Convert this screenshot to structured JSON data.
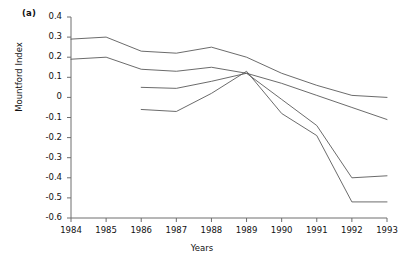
{
  "figure": {
    "panel_label": "(a)",
    "xlabel": "Years",
    "ylabel": "Mountford Index"
  },
  "chart_data": {
    "type": "line",
    "title": "",
    "subtitle": "",
    "panel_label": "(a)",
    "xlabel": "Years",
    "ylabel": "Mountford Index",
    "x": [
      1984,
      1985,
      1986,
      1987,
      1988,
      1989,
      1990,
      1991,
      1992,
      1993
    ],
    "xtick_labels": [
      "1984",
      "1985",
      "1986",
      "1987",
      "1988",
      "1989",
      "1990",
      "1991",
      "1992",
      "1993"
    ],
    "ytick_labels": [
      "0.4",
      "0.3",
      "0.2",
      "0.1",
      "0",
      "-0.1",
      "-0.2",
      "-0.3",
      "-0.4",
      "-0.5",
      "-0.6"
    ],
    "ytick_values": [
      0.4,
      0.3,
      0.2,
      0.1,
      0,
      -0.1,
      -0.2,
      -0.3,
      -0.4,
      -0.5,
      -0.6
    ],
    "xlim": [
      1984,
      1993
    ],
    "ylim": [
      -0.6,
      0.4
    ],
    "grid": false,
    "legend": "none",
    "line_color": "#5a5a5a",
    "series": [
      {
        "name": "series-1",
        "x": [
          1984,
          1985,
          1986,
          1987,
          1988,
          1989,
          1990,
          1991,
          1992,
          1993
        ],
        "values": [
          0.29,
          0.3,
          0.23,
          0.22,
          0.25,
          0.2,
          0.12,
          0.06,
          0.01,
          0.0
        ]
      },
      {
        "name": "series-2",
        "x": [
          1984,
          1985,
          1986,
          1987,
          1988,
          1989,
          1990,
          1991,
          1992,
          1993
        ],
        "values": [
          0.19,
          0.2,
          0.14,
          0.13,
          0.15,
          0.12,
          0.07,
          0.01,
          -0.05,
          -0.11
        ]
      },
      {
        "name": "series-3",
        "x": [
          1986,
          1987,
          1988,
          1989,
          1990,
          1991,
          1992,
          1993
        ],
        "values": [
          0.05,
          0.045,
          0.08,
          0.12,
          -0.01,
          -0.14,
          -0.4,
          -0.39
        ]
      },
      {
        "name": "series-4",
        "x": [
          1986,
          1987,
          1988,
          1989,
          1990,
          1991,
          1992,
          1993
        ],
        "values": [
          -0.06,
          -0.07,
          0.02,
          0.13,
          -0.08,
          -0.19,
          -0.52,
          -0.52
        ]
      }
    ]
  }
}
